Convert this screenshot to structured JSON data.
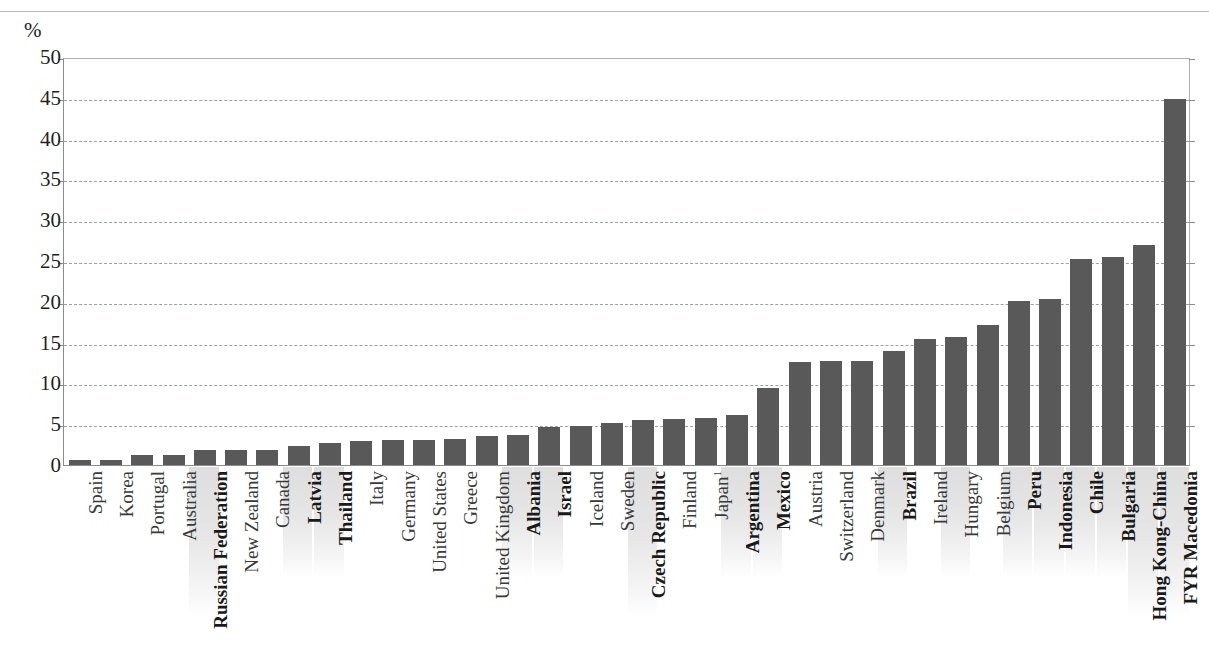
{
  "axis_unit_label": "%",
  "colors": {
    "bar": "#595959",
    "gridline": "#9aa0a6",
    "axis": "#8c8c8c",
    "highlight_band": "#e0e0e0",
    "text": "#231f20"
  },
  "chart_data": {
    "type": "bar",
    "title": "",
    "subtitle": "",
    "xlabel": "",
    "ylabel": "%",
    "ylim": [
      0,
      50
    ],
    "ytick_step": 5,
    "yticks": [
      0,
      5,
      10,
      15,
      20,
      25,
      30,
      35,
      40,
      45,
      50
    ],
    "ytick_labels": [
      "0",
      "5",
      "10",
      "15",
      "20",
      "25",
      "30",
      "35",
      "40",
      "45",
      "50"
    ],
    "grid": true,
    "grid_axis": "y",
    "grid_style": "dashed",
    "legend": false,
    "legend_position": "none",
    "orientation": "vertical",
    "sorted": "ascending",
    "categories": [
      "Spain",
      "Korea",
      "Portugal",
      "Australia",
      "Russian Federation",
      "New Zealand",
      "Canada",
      "Latvia",
      "Thailand",
      "Italy",
      "Germany",
      "United States",
      "Greece",
      "United Kingdom",
      "Albania",
      "Israel",
      "Iceland",
      "Sweden",
      "Czech Republic",
      "Finland",
      "Japan",
      "Argentina",
      "Mexico",
      "Austria",
      "Switzerland",
      "Denmark",
      "Brazil",
      "Ireland",
      "Hungary",
      "Belgium",
      "Peru",
      "Indonesia",
      "Chile",
      "Bulgaria",
      "Hong Kong-China",
      "FYR Macedonia"
    ],
    "category_footnotes": {
      "Japan": "1"
    },
    "emphasised_categories": [
      "Russian Federation",
      "Latvia",
      "Thailand",
      "Albania",
      "Israel",
      "Czech Republic",
      "Argentina",
      "Mexico",
      "Brazil",
      "Peru",
      "Indonesia",
      "Chile",
      "Bulgaria",
      "Hong Kong-China",
      "FYR Macedonia"
    ],
    "highlighted_label_bands": [
      "Russian Federation",
      "Latvia",
      "Thailand",
      "Albania",
      "Israel",
      "Czech Republic",
      "Argentina",
      "Mexico",
      "Brazil",
      "Hungary",
      "Peru",
      "Indonesia",
      "Chile",
      "Bulgaria",
      "Hong Kong-China",
      "FYR Macedonia"
    ],
    "values": [
      0.6,
      0.6,
      1.2,
      1.2,
      1.8,
      1.8,
      1.8,
      2.3,
      2.7,
      2.9,
      3.1,
      3.1,
      3.2,
      3.5,
      3.7,
      4.6,
      4.8,
      5.1,
      5.5,
      5.6,
      5.8,
      6.1,
      9.4,
      12.6,
      12.7,
      12.8,
      14.0,
      15.4,
      15.7,
      17.1,
      20.1,
      20.4,
      25.3,
      25.5,
      27.0,
      44.8
    ]
  }
}
